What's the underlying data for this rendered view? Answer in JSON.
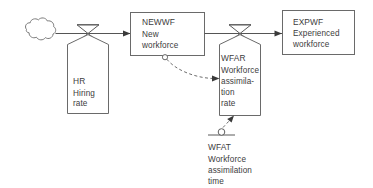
{
  "diagram": {
    "type": "stock-and-flow",
    "source_cloud": {
      "name": "source-cloud",
      "label": ""
    },
    "stocks": [
      {
        "id": "NEWWF",
        "code": "NEWWF",
        "name_lines": [
          "New",
          "workforce"
        ],
        "full_name": "New workforce"
      },
      {
        "id": "EXPWF",
        "code": "EXPWF",
        "name_lines": [
          "Experienced",
          "workforce"
        ],
        "full_name": "Experienced workforce"
      }
    ],
    "rates": [
      {
        "id": "HR",
        "code": "HR",
        "name_lines": [
          "Hiring",
          "rate"
        ],
        "full_name": "Hiring rate"
      },
      {
        "id": "WFAR",
        "code": "WFAR",
        "name_lines": [
          "Workforce",
          "assimila-",
          "tion",
          "rate"
        ],
        "full_name": "Workforce assimilation rate"
      }
    ],
    "constants": [
      {
        "id": "WFAT",
        "code": "WFAT",
        "name_lines": [
          "Workforce",
          "assimilation",
          "time"
        ],
        "full_name": "Workforce assimilation time"
      }
    ],
    "flows": [
      {
        "from": "source-cloud",
        "to": "NEWWF",
        "via": "HR"
      },
      {
        "from": "NEWWF",
        "to": "EXPWF",
        "via": "WFAR"
      }
    ],
    "information_links": [
      {
        "from": "NEWWF",
        "to": "WFAR",
        "style": "dashed"
      },
      {
        "from": "WFAT",
        "to": "WFAR",
        "style": "dashed"
      }
    ],
    "colors": {
      "background": "#ffffff",
      "line": "#5a5a5a",
      "text": "#3c3c3c",
      "arrow": "#3a3a3a"
    }
  }
}
